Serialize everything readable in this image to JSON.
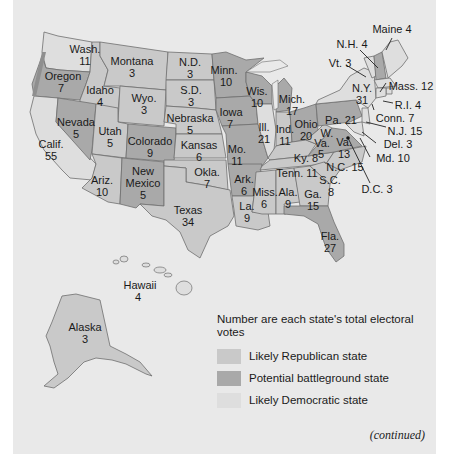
{
  "map": {
    "title_cut": "",
    "colors": {
      "republican": "#c9c9c9",
      "battleground": "#a9a9a9",
      "democratic": "#dedede",
      "background": "#e9e9e9",
      "water": "#e9e9e9"
    },
    "states": [
      {
        "abbr": "Wash.",
        "votes": "11",
        "category": "democratic"
      },
      {
        "abbr": "Oregon",
        "votes": "7",
        "category": "battleground"
      },
      {
        "abbr": "Calif.",
        "votes": "55",
        "category": "democratic"
      },
      {
        "abbr": "Idaho",
        "votes": "4",
        "category": "republican"
      },
      {
        "abbr": "Nevada",
        "votes": "5",
        "category": "battleground"
      },
      {
        "abbr": "Montana",
        "votes": "3",
        "category": "republican"
      },
      {
        "abbr": "Wyo.",
        "votes": "3",
        "category": "republican"
      },
      {
        "abbr": "Utah",
        "votes": "5",
        "category": "republican"
      },
      {
        "abbr": "Colorado",
        "votes": "9",
        "category": "battleground"
      },
      {
        "abbr": "Ariz.",
        "votes": "10",
        "category": "republican"
      },
      {
        "abbr": "New Mexico",
        "votes": "5",
        "category": "battleground"
      },
      {
        "abbr": "N.D.",
        "votes": "3",
        "category": "republican"
      },
      {
        "abbr": "S.D.",
        "votes": "3",
        "category": "republican"
      },
      {
        "abbr": "Nebraska",
        "votes": "5",
        "category": "republican"
      },
      {
        "abbr": "Kansas",
        "votes": "6",
        "category": "republican"
      },
      {
        "abbr": "Okla.",
        "votes": "7",
        "category": "republican"
      },
      {
        "abbr": "Texas",
        "votes": "34",
        "category": "republican"
      },
      {
        "abbr": "Minn.",
        "votes": "10",
        "category": "battleground"
      },
      {
        "abbr": "Iowa",
        "votes": "7",
        "category": "battleground"
      },
      {
        "abbr": "Mo.",
        "votes": "11",
        "category": "battleground"
      },
      {
        "abbr": "Ark.",
        "votes": "6",
        "category": "battleground"
      },
      {
        "abbr": "La.",
        "votes": "9",
        "category": "republican"
      },
      {
        "abbr": "Wis.",
        "votes": "10",
        "category": "battleground"
      },
      {
        "abbr": "Ill.",
        "votes": "21",
        "category": "democratic"
      },
      {
        "abbr": "Mich.",
        "votes": "17",
        "category": "battleground"
      },
      {
        "abbr": "Ind.",
        "votes": "11",
        "category": "republican"
      },
      {
        "abbr": "Ohio",
        "votes": "20",
        "category": "battleground"
      },
      {
        "abbr": "Ky.",
        "votes": "8",
        "category": "republican"
      },
      {
        "abbr": "Tenn.",
        "votes": "11",
        "category": "republican"
      },
      {
        "abbr": "Miss.",
        "votes": "6",
        "category": "republican"
      },
      {
        "abbr": "Ala.",
        "votes": "9",
        "category": "republican"
      },
      {
        "abbr": "Ga.",
        "votes": "15",
        "category": "republican"
      },
      {
        "abbr": "Fla.",
        "votes": "27",
        "category": "battleground"
      },
      {
        "abbr": "S.C.",
        "votes": "8",
        "category": "republican"
      },
      {
        "abbr": "N.C.",
        "votes": "15",
        "category": "republican"
      },
      {
        "abbr": "Va.",
        "votes": "13",
        "category": "battleground"
      },
      {
        "abbr": "W. Va.",
        "votes": "5",
        "category": "republican"
      },
      {
        "abbr": "Pa.",
        "votes": "21",
        "category": "battleground"
      },
      {
        "abbr": "N.Y.",
        "votes": "31",
        "category": "democratic"
      },
      {
        "abbr": "Vt.",
        "votes": "3",
        "category": "democratic"
      },
      {
        "abbr": "N.H.",
        "votes": "4",
        "category": "battleground"
      },
      {
        "abbr": "Maine",
        "votes": "4",
        "category": "democratic"
      },
      {
        "abbr": "Mass.",
        "votes": "12",
        "category": "democratic"
      },
      {
        "abbr": "R.I.",
        "votes": "4",
        "category": "democratic"
      },
      {
        "abbr": "Conn.",
        "votes": "7",
        "category": "democratic"
      },
      {
        "abbr": "N.J.",
        "votes": "15",
        "category": "democratic"
      },
      {
        "abbr": "Del.",
        "votes": "3",
        "category": "democratic"
      },
      {
        "abbr": "Md.",
        "votes": "10",
        "category": "democratic"
      },
      {
        "abbr": "D.C.",
        "votes": "3",
        "category": "democratic"
      },
      {
        "abbr": "Hawaii",
        "votes": "4",
        "category": "democratic"
      },
      {
        "abbr": "Alaska",
        "votes": "3",
        "category": "republican"
      }
    ],
    "labels": {
      "wash": "Wash.",
      "wash_v": "11",
      "oregon": "Oregon",
      "oregon_v": "7",
      "calif": "Calif.",
      "calif_v": "55",
      "idaho": "Idaho",
      "idaho_v": "4",
      "nevada": "Nevada",
      "nevada_v": "5",
      "montana": "Montana",
      "montana_v": "3",
      "wyo": "Wyo.",
      "wyo_v": "3",
      "utah": "Utah",
      "utah_v": "5",
      "colorado": "Colorado",
      "colorado_v": "9",
      "ariz": "Ariz.",
      "ariz_v": "10",
      "nm1": "New",
      "nm2": "Mexico",
      "nm_v": "5",
      "nd": "N.D.",
      "nd_v": "3",
      "sd": "S.D.",
      "sd_v": "3",
      "nebraska": "Nebraska",
      "nebraska_v": "5",
      "kansas": "Kansas",
      "kansas_v": "6",
      "okla": "Okla.",
      "okla_v": "7",
      "texas": "Texas",
      "texas_v": "34",
      "minn": "Minn.",
      "minn_v": "10",
      "iowa": "Iowa",
      "iowa_v": "7",
      "mo": "Mo.",
      "mo_v": "11",
      "ark": "Ark.",
      "ark_v": "6",
      "la": "La.",
      "la_v": "9",
      "wis": "Wis.",
      "wis_v": "10",
      "ill": "Ill.",
      "ill_v": "21",
      "mich": "Mich.",
      "mich_v": "17",
      "ind": "Ind.",
      "ind_v": "11",
      "ohio": "Ohio",
      "ohio_v": "20",
      "ky": "Ky. 8",
      "tenn": "Tenn. 11",
      "miss": "Miss.",
      "miss_v": "6",
      "ala": "Ala.",
      "ala_v": "9",
      "ga": "Ga.",
      "ga_v": "15",
      "fla": "Fla.",
      "fla_v": "27",
      "sc": "S.C.",
      "sc_v": "8",
      "nc": "N.C. 15",
      "va": "Va.",
      "va_v": "13",
      "wva1": "W.",
      "wva2": "Va.",
      "wva_v": "5",
      "pa": "Pa. 21",
      "ny": "N.Y.",
      "ny_v": "31",
      "vt": "Vt. 3",
      "nh": "N.H. 4",
      "maine": "Maine 4",
      "mass": "Mass. 12",
      "ri": "R.I. 4",
      "conn": "Conn. 7",
      "nj": "N.J. 15",
      "del": "Del. 3",
      "md": "Md. 10",
      "dc": "D.C. 3",
      "hawaii": "Hawaii",
      "hawaii_v": "4",
      "alaska": "Alaska",
      "alaska_v": "3"
    }
  },
  "legend": {
    "title": "Number are each state's total electoral votes",
    "items": [
      {
        "label": "Likely Republican state",
        "color": "#c9c9c9"
      },
      {
        "label": "Potential battleground state",
        "color": "#a9a9a9"
      },
      {
        "label": "Likely Democratic state",
        "color": "#dedede"
      }
    ]
  },
  "footer": {
    "continued": "(continued)"
  }
}
